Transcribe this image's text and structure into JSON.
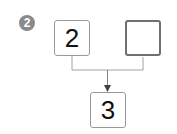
{
  "badge": {
    "number": "2"
  },
  "boxes": {
    "left": {
      "value": "2"
    },
    "right": {
      "value": ""
    },
    "result": {
      "value": "3"
    }
  },
  "colors": {
    "badge": "#8a8a8a",
    "line": "#9a9a9a",
    "box_border": "#9a9a9a"
  }
}
